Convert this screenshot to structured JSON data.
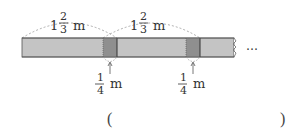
{
  "diagram": {
    "strip_color": "#c4c4c4",
    "overlap_color": "#8f8f8f",
    "border_color": "#444444",
    "labels": {
      "segment_length": {
        "whole": "1",
        "numerator": "2",
        "denominator": "3",
        "unit": "m"
      },
      "overlap_length": {
        "numerator": "1",
        "denominator": "4",
        "unit": "m"
      },
      "continuation": "…"
    }
  },
  "answer": {
    "open_paren": "(",
    "close_paren": ")",
    "value": ""
  }
}
